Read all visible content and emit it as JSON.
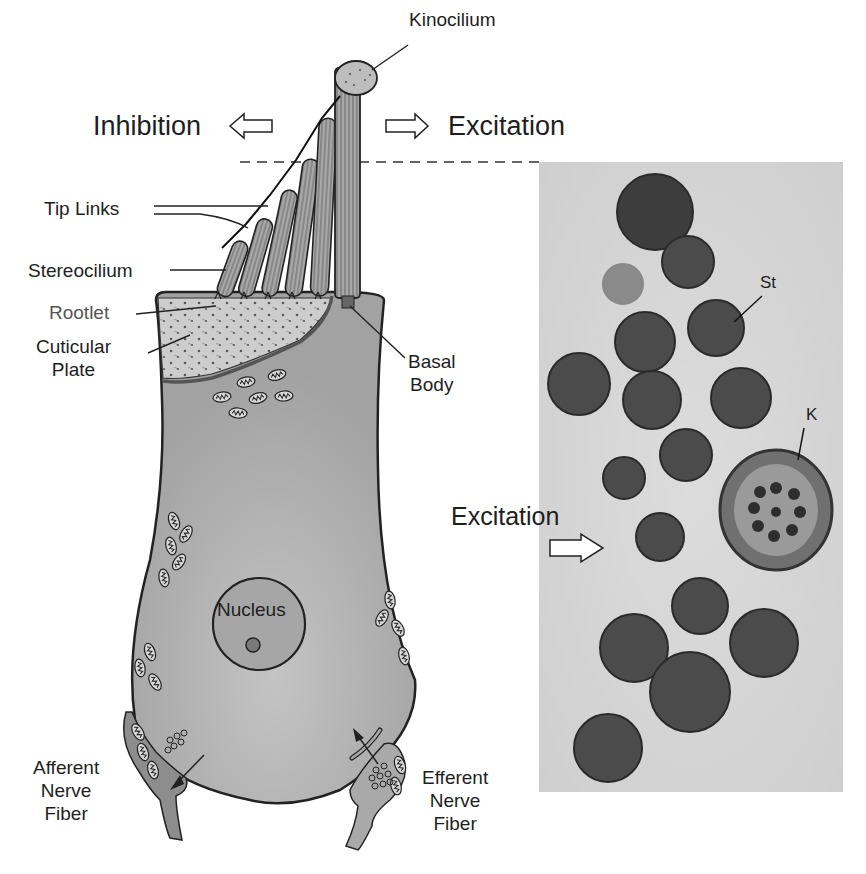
{
  "figure": {
    "labels": {
      "kinocilium": "Kinocilium",
      "inhibition": "Inhibition",
      "excitation_top": "Excitation",
      "tip_links": "Tip Links",
      "stereocilium": "Stereocilium",
      "rootlet": "Rootlet",
      "cuticular_plate_line1": "Cuticular",
      "cuticular_plate_line2": "Plate",
      "basal_body_line1": "Basal",
      "basal_body_line2": "Body",
      "nucleus": "Nucleus",
      "afferent_line1": "Afferent",
      "afferent_line2": "Nerve",
      "afferent_line3": "Fiber",
      "efferent_line1": "Efferent",
      "efferent_line2": "Nerve",
      "efferent_line3": "Fiber"
    },
    "micrograph": {
      "excitation": "Excitation",
      "st_label": "St",
      "k_label": "K"
    },
    "colors": {
      "cell_body": "#a9a9a9",
      "cuticular_plate": "#c9c9c9",
      "outline": "#222222",
      "micrograph_bg": "#d6d6d6",
      "profile_dark": "#4a4a4a"
    }
  }
}
